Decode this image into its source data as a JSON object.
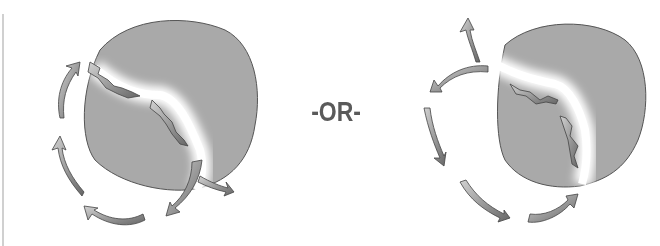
{
  "diagram": {
    "separator_text": "-OR-",
    "colors": {
      "disc_fill": "#a9a9a9",
      "disc_stroke": "#555555",
      "crack": "#ffffff",
      "arrow_fill_light": "#c8c8c8",
      "arrow_fill_dark": "#6e6e6e",
      "text": "#5a5a5a"
    },
    "panels": [
      {
        "name": "left-option",
        "description": "grey disc split by a white crack; arrows flow along the crack outward and circulate counterclockwise around the left side"
      },
      {
        "name": "right-option",
        "description": "grey disc split by a white crack; arrows flow along the crack inward/upward and circulate around the left side"
      }
    ]
  }
}
